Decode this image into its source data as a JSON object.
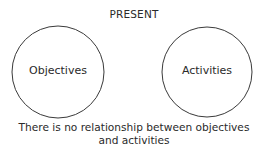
{
  "title": "PRESENT",
  "circles": [
    {
      "label": "Objectives",
      "cx": 58,
      "cy": 72,
      "r": 46
    },
    {
      "label": "Activities",
      "cx": 207,
      "cy": 72,
      "r": 45
    }
  ],
  "caption": {
    "line1": "There is no relationship between objectives",
    "line2": "and activities"
  },
  "colors": {
    "stroke": "#3a3a3a",
    "text": "#2a2a2a",
    "background": "#ffffff"
  }
}
